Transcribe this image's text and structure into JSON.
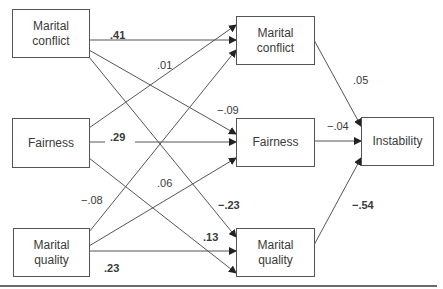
{
  "diagram": {
    "type": "path-model",
    "nodes": {
      "left_conflict": {
        "label": "Marital\nconflict"
      },
      "left_fairness": {
        "label": "Fairness"
      },
      "left_quality": {
        "label": "Marital\nquality"
      },
      "mid_conflict": {
        "label": "Marital\nconflict"
      },
      "mid_fairness": {
        "label": "Fairness"
      },
      "mid_quality": {
        "label": "Marital\nquality"
      },
      "instability": {
        "label": "Instability"
      }
    },
    "edges": [
      {
        "from": "left_conflict",
        "to": "mid_conflict",
        "coef": ".41",
        "bold": true
      },
      {
        "from": "left_fairness",
        "to": "mid_conflict",
        "coef": ".01",
        "bold": false
      },
      {
        "from": "left_quality",
        "to": "mid_conflict",
        "coef": "−.08",
        "bold": false
      },
      {
        "from": "left_conflict",
        "to": "mid_fairness",
        "coef": "−.09",
        "bold": false
      },
      {
        "from": "left_fairness",
        "to": "mid_fairness",
        "coef": ".29",
        "bold": true
      },
      {
        "from": "left_quality",
        "to": "mid_fairness",
        "coef": ".06",
        "bold": false
      },
      {
        "from": "left_conflict",
        "to": "mid_quality",
        "coef": "−.23",
        "bold": true
      },
      {
        "from": "left_fairness",
        "to": "mid_quality",
        "coef": ".13",
        "bold": true
      },
      {
        "from": "left_quality",
        "to": "mid_quality",
        "coef": ".23",
        "bold": true
      },
      {
        "from": "mid_conflict",
        "to": "instability",
        "coef": ".05",
        "bold": false
      },
      {
        "from": "mid_fairness",
        "to": "instability",
        "coef": "−.04",
        "bold": false
      },
      {
        "from": "mid_quality",
        "to": "instability",
        "coef": "−.54",
        "bold": true
      }
    ]
  }
}
